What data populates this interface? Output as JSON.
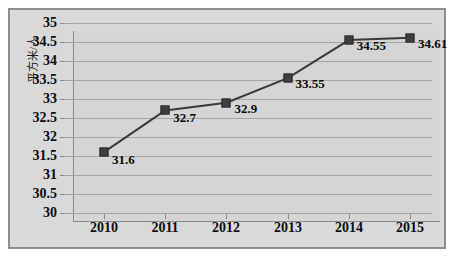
{
  "chart_data": {
    "type": "line",
    "title": "",
    "subtitle": "",
    "xlabel": "",
    "ylabel": "平方米/人",
    "categories": [
      "2010",
      "2011",
      "2012",
      "2013",
      "2014",
      "2015"
    ],
    "values": [
      31.6,
      32.7,
      32.9,
      33.55,
      34.55,
      34.61
    ],
    "point_labels": [
      "31.6",
      "32.7",
      "32.9",
      "33.55",
      "34.55",
      "34.61"
    ],
    "ylim": [
      30,
      35
    ],
    "ytick_labels": [
      "35",
      "34.5",
      "34",
      "33.5",
      "33",
      "32.5",
      "32",
      "31.5",
      "31",
      "30.5",
      "30"
    ],
    "ytick_values": [
      35,
      34.5,
      34,
      33.5,
      33,
      32.5,
      32,
      31.5,
      31,
      30.5,
      30
    ],
    "ystep": 0.5,
    "grid": "horizontal",
    "legend": "none",
    "series": [
      {
        "name": "",
        "values": [
          31.6,
          32.7,
          32.9,
          33.55,
          34.55,
          34.61
        ]
      }
    ],
    "colors": {
      "line": "#3a3a3a",
      "marker": "#3f3f3f",
      "plot_background": "#d5d5d5",
      "chart_background": "#d9d9d9",
      "gridline": "#a6a6a6",
      "axis": "#8a8a8a",
      "border": "#8d8d8d",
      "text": "#0d0d0d",
      "page_background": "#ffffff"
    }
  }
}
